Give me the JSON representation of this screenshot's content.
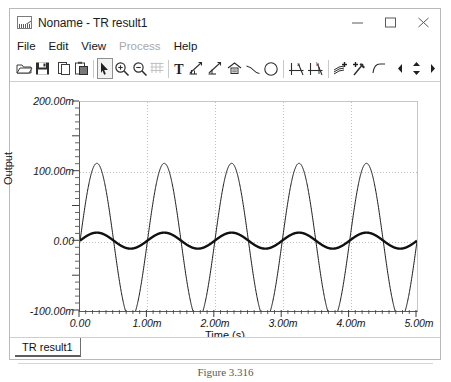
{
  "window": {
    "title": "Noname - TR result1",
    "app_icon": "waveform-icon",
    "controls": {
      "minimize": "minimize-icon",
      "maximize": "maximize-icon",
      "close": "close-icon"
    }
  },
  "menubar": {
    "items": [
      {
        "label": "File",
        "disabled": false
      },
      {
        "label": "Edit",
        "disabled": false
      },
      {
        "label": "View",
        "disabled": false
      },
      {
        "label": "Process",
        "disabled": true
      },
      {
        "label": "Help",
        "disabled": false
      }
    ]
  },
  "toolbar": {
    "buttons": [
      {
        "name": "open-icon",
        "tooltip": "Open"
      },
      {
        "name": "save-icon",
        "tooltip": "Save"
      },
      {
        "name": "copy-icon",
        "tooltip": "Copy"
      },
      {
        "name": "paste-icon",
        "tooltip": "Paste"
      },
      {
        "name": "select-arrow-icon",
        "tooltip": "Select",
        "pressed": true
      },
      {
        "name": "zoom-in-icon",
        "tooltip": "Zoom In"
      },
      {
        "name": "zoom-out-icon",
        "tooltip": "Zoom Out"
      },
      {
        "name": "grid-icon",
        "tooltip": "Grid"
      },
      {
        "name": "text-tool-icon",
        "tooltip": "Text"
      },
      {
        "name": "marker-a-icon",
        "tooltip": "Marker"
      },
      {
        "name": "marker-b-icon",
        "tooltip": "Marker"
      },
      {
        "name": "label-box-icon",
        "tooltip": "Label"
      },
      {
        "name": "line-tool-icon",
        "tooltip": "Line"
      },
      {
        "name": "ellipse-tool-icon",
        "tooltip": "Ellipse"
      },
      {
        "name": "axis-a-icon",
        "tooltip": "Axis a"
      },
      {
        "name": "axis-b-icon",
        "tooltip": "Axis b"
      },
      {
        "name": "add-trace-icon",
        "tooltip": "Add Trace"
      },
      {
        "name": "add-curve-icon",
        "tooltip": "Add Curve"
      },
      {
        "name": "corner-tool-icon",
        "tooltip": "Corner"
      },
      {
        "name": "prev-icon",
        "tooltip": "Previous"
      },
      {
        "name": "spinner-icon",
        "tooltip": "Step"
      },
      {
        "name": "next-icon",
        "tooltip": "Next"
      }
    ]
  },
  "tabs": {
    "items": [
      {
        "label": "TR result1",
        "active": true
      }
    ]
  },
  "caption": {
    "text": "Figure 3.316"
  },
  "chart_data": {
    "type": "line",
    "title": "",
    "xlabel": "Time (s)",
    "ylabel": "Output",
    "xlim": [
      0,
      0.005
    ],
    "ylim": [
      -0.1,
      0.2
    ],
    "grid": true,
    "legend": "none",
    "x_ticks": [
      0,
      0.001,
      0.002,
      0.003,
      0.004,
      0.005
    ],
    "x_tick_labels": [
      "0.00",
      "1.00m",
      "2.00m",
      "3.00m",
      "4.00m",
      "5.00m"
    ],
    "y_ticks": [
      0.2,
      0.1,
      0.0,
      -0.1
    ],
    "y_tick_labels": [
      "200.00m",
      "100.00m",
      "0.00",
      "-100.00m"
    ],
    "minor_ticks_per_major": 5,
    "series": [
      {
        "name": "large-sine",
        "stroke": "#1a1a1a",
        "stroke_width": 1,
        "waveform": "sine",
        "amplitude": 0.112,
        "offset": 0.0,
        "frequency_hz": 1000,
        "phase_deg": 0,
        "start_value": 0.0
      },
      {
        "name": "small-sine",
        "stroke": "#111111",
        "stroke_width": 2.4,
        "waveform": "sine",
        "amplitude": 0.0115,
        "offset": 0.001,
        "frequency_hz": 1000,
        "phase_deg": 0,
        "start_value": 0.0
      }
    ]
  },
  "colors": {
    "window_border": "#b9b9b9",
    "axis": "#5a5a5a",
    "grid": "#bfbfbf",
    "text": "#161616",
    "disabled_text": "#a8a8a8"
  }
}
